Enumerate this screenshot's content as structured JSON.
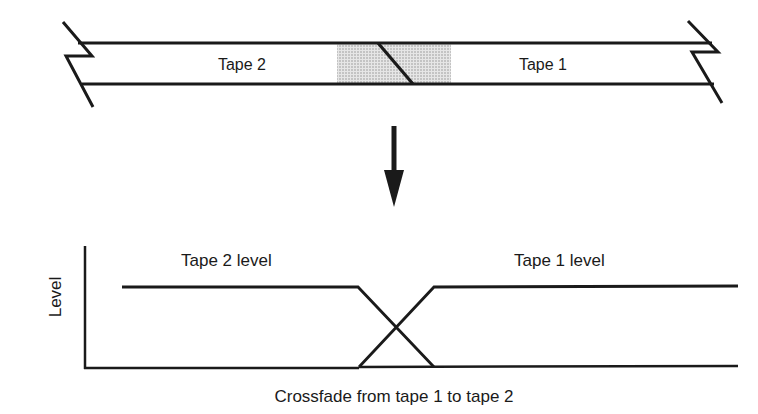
{
  "diagram": {
    "tape": {
      "left_label": "Tape 2",
      "right_label": "Tape 1",
      "splice_shading_color": "#c8c8c8"
    },
    "arrow": {
      "direction": "down"
    },
    "graph": {
      "y_axis_label": "Level",
      "x_axis_label": "Crossfade from tape 1 to tape 2",
      "series_labels": {
        "tape2": "Tape 2 level",
        "tape1": "Tape 1 level"
      }
    },
    "line_color": "#1a1a1a"
  }
}
